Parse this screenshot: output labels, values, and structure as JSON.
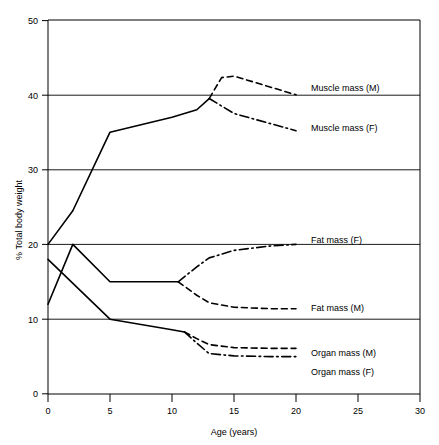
{
  "chart_data": {
    "type": "line",
    "title": "",
    "xlabel": "Age (years)",
    "ylabel": "% Total body weight",
    "xlim": [
      0,
      30
    ],
    "ylim": [
      0,
      50
    ],
    "xticks": [
      0,
      5,
      10,
      15,
      20,
      25,
      30
    ],
    "yticks": [
      0,
      10,
      20,
      30,
      40,
      50
    ],
    "xtick_labels": [
      "0",
      "5",
      "10",
      "15",
      "20",
      "25",
      "30"
    ],
    "ytick_labels": [
      "0",
      "10",
      "20",
      "30",
      "40",
      "50"
    ],
    "grid": "horizontal gridlines at 10, 20, 30, 40",
    "legend_position": "inline labels at right end of each curve",
    "series": [
      {
        "name": "Muscle mass (shared trunk)",
        "label": "",
        "style": "solid",
        "x": [
          0,
          2,
          5,
          10,
          12,
          13
        ],
        "values": [
          20,
          24.5,
          35,
          37,
          38,
          39.5
        ]
      },
      {
        "name": "Muscle mass (M)",
        "label": "Muscle mass (M)",
        "style": "dashed",
        "x": [
          13,
          14,
          15,
          20
        ],
        "values": [
          39.5,
          42.3,
          42.5,
          40
        ]
      },
      {
        "name": "Muscle mass (F)",
        "label": "Muscle mass (F)",
        "style": "dash-dot",
        "x": [
          13,
          15,
          20
        ],
        "values": [
          39.5,
          37.5,
          35.2
        ]
      },
      {
        "name": "Fat mass (shared trunk)",
        "label": "",
        "style": "solid",
        "x": [
          0,
          2,
          5,
          10.5
        ],
        "values": [
          12,
          20,
          15,
          15
        ]
      },
      {
        "name": "Fat mass (F)",
        "label": "Fat mass (F)",
        "style": "dash-dot",
        "x": [
          10.5,
          12,
          13,
          15,
          18,
          20
        ],
        "values": [
          15,
          17,
          18.2,
          19.2,
          19.8,
          20
        ]
      },
      {
        "name": "Fat mass (M)",
        "label": "Fat mass (M)",
        "style": "dashed",
        "x": [
          10.5,
          12,
          13,
          15,
          18,
          20
        ],
        "values": [
          15,
          13.2,
          12.2,
          11.6,
          11.4,
          11.4
        ]
      },
      {
        "name": "Organ mass (shared trunk)",
        "label": "",
        "style": "solid",
        "x": [
          0,
          5,
          10,
          11
        ],
        "values": [
          18,
          10,
          8.6,
          8.3
        ]
      },
      {
        "name": "Organ mass (M)",
        "label": "Organ mass (M)",
        "style": "dashed",
        "x": [
          11,
          12,
          13,
          15,
          18,
          20
        ],
        "values": [
          8.3,
          7.4,
          6.6,
          6.2,
          6.1,
          6.1
        ]
      },
      {
        "name": "Organ mass (F)",
        "label": "Organ mass (F)",
        "style": "dash-dot",
        "x": [
          11,
          12,
          13,
          15,
          18,
          20
        ],
        "values": [
          8.3,
          6.8,
          5.4,
          5.1,
          5.0,
          5.0
        ]
      }
    ],
    "annotations": [
      {
        "text": "Muscle mass (M)",
        "x": 21.2,
        "y": 40.2
      },
      {
        "text": "Muscle mass (F)",
        "x": 21.2,
        "y": 35.2
      },
      {
        "text": "Fat mass (F)",
        "x": 21.2,
        "y": 20.4
      },
      {
        "text": "Fat mass (M)",
        "x": 21.2,
        "y": 11.5
      },
      {
        "text": "Organ mass (M)",
        "x": 21.2,
        "y": 6.1
      },
      {
        "text": "Organ mass (F)",
        "x": 21.2,
        "y": 3.6
      }
    ]
  },
  "axes": {
    "y_title": "% Total body weight",
    "x_title": "Age (years)",
    "y_labels": [
      "50",
      "40",
      "30",
      "20",
      "10",
      "0"
    ],
    "x_labels": [
      "0",
      "5",
      "10",
      "15",
      "20",
      "25",
      "30"
    ]
  },
  "labels": {
    "muscle_m": "Muscle mass (M)",
    "muscle_f": "Muscle mass (F)",
    "fat_f": "Fat mass (F)",
    "fat_m": "Fat mass (M)",
    "organ_m": "Organ mass (M)",
    "organ_f": "Organ mass (F)"
  },
  "colors": {
    "line": "#000000",
    "background": "#ffffff",
    "grid": "#000000"
  }
}
